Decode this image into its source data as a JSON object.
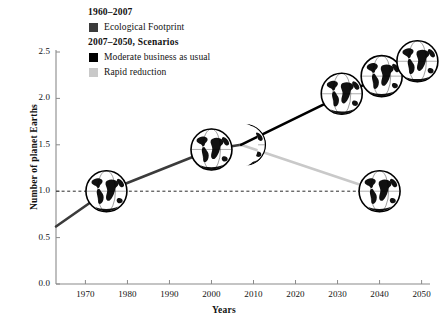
{
  "chart_data": {
    "type": "line",
    "title": "",
    "xlabel": "Years",
    "ylabel": "Number of planet Earths",
    "xlim": [
      1963,
      2052
    ],
    "ylim": [
      0.0,
      2.5
    ],
    "grid": false,
    "legend_position": "top-left",
    "x_ticks": [
      "1970",
      "1980",
      "1990",
      "2000",
      "2010",
      "2020",
      "2030",
      "2040",
      "2050"
    ],
    "x_tick_values": [
      1970,
      1980,
      1990,
      2000,
      2010,
      2020,
      2030,
      2040,
      2050
    ],
    "y_ticks": [
      "0.0",
      "0.5",
      "1.0",
      "1.5",
      "2.0",
      "2.5"
    ],
    "y_tick_values": [
      0.0,
      0.5,
      1.0,
      1.5,
      2.0,
      2.5
    ],
    "reference_line": {
      "label": "one planet Earth",
      "y": 1.0,
      "x_start": 1963,
      "x_end": 2040,
      "style": "dashed"
    },
    "series": [
      {
        "name": "Ecological Footprint",
        "period": "1960-2007",
        "color": "#3b3b3b",
        "style": "solid",
        "x": [
          1963,
          1975,
          2000,
          2007
        ],
        "values": [
          0.62,
          1.0,
          1.45,
          1.5
        ]
      },
      {
        "name": "Moderate business as usual",
        "period": "2007-2050",
        "color": "#000000",
        "style": "solid",
        "x": [
          2007,
          2050
        ],
        "values": [
          1.5,
          2.45
        ]
      },
      {
        "name": "Rapid reduction",
        "period": "2007-2050",
        "color": "#c9c9c9",
        "style": "solid",
        "x": [
          2007,
          2040
        ],
        "values": [
          1.5,
          1.0
        ]
      }
    ],
    "markers": [
      {
        "label": "globe-1975",
        "x": 1975,
        "y": 1.0,
        "radius": 21,
        "clip": "full"
      },
      {
        "label": "globe-2000",
        "x": 2000,
        "y": 1.45,
        "radius": 21,
        "clip": "full"
      },
      {
        "label": "globe-2007",
        "x": 2008,
        "y": 1.5,
        "radius": 21,
        "clip": "crescent"
      },
      {
        "label": "globe-2032",
        "x": 2031,
        "y": 2.05,
        "radius": 21,
        "clip": "full"
      },
      {
        "label": "globe-2040",
        "x": 2040.5,
        "y": 2.24,
        "radius": 21,
        "clip": "full"
      },
      {
        "label": "globe-2048",
        "x": 2049,
        "y": 2.4,
        "radius": 21,
        "clip": "full"
      },
      {
        "label": "globe-2040-low",
        "x": 2040,
        "y": 1.0,
        "radius": 21,
        "clip": "full"
      }
    ]
  },
  "legend": {
    "heading_historic": "1960–2007",
    "heading_scenarios": "2007–2050, Scenarios",
    "items": [
      {
        "label": "Ecological Footprint",
        "color": "#3b3b3b"
      },
      {
        "label": "Moderate business as usual",
        "color": "#000000"
      },
      {
        "label": "Rapid reduction",
        "color": "#c9c9c9"
      }
    ]
  },
  "axes": {
    "y_title": "Number of planet Earths",
    "x_title": "Years",
    "axis_color": "#8a8a8a"
  }
}
